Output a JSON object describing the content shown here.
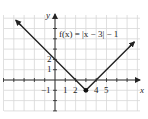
{
  "chart_data": {
    "type": "line",
    "title": "",
    "function_label": "f(x) = |x − 3| − 1",
    "xlabel": "x",
    "ylabel": "y",
    "xlim": [
      -5,
      8
    ],
    "ylim": [
      -3,
      6.3
    ],
    "grid": true,
    "x_tick_labels": [
      "-1",
      "1",
      "2",
      "4",
      "5"
    ],
    "y_tick_labels": [
      "2",
      "1",
      "-1"
    ],
    "x_tick_values": [
      1,
      2,
      4,
      5
    ],
    "y_tick_values": [
      2,
      1,
      -1
    ],
    "series": [
      {
        "name": "f(x) = |x - 3| - 1",
        "x": [
          -3.8,
          3,
          7.7
        ],
        "y": [
          5.8,
          -1,
          3.7
        ],
        "arrows_at_ends": true
      }
    ],
    "points": [
      {
        "label": "vertex",
        "x": 3,
        "y": -1,
        "filled": true
      }
    ],
    "colors": {
      "line": "#222222",
      "grid": "#d8d8d8",
      "axes": "#333333"
    }
  },
  "labels": {
    "y_axis": "y",
    "x_axis": "x",
    "function": "f(x) = |x − 3| − 1",
    "ytick_2": "2",
    "ytick_1": "1",
    "ytick_neg1": "−1",
    "xtick_1": "1",
    "xtick_2": "2",
    "xtick_4": "4",
    "xtick_5": "5"
  }
}
